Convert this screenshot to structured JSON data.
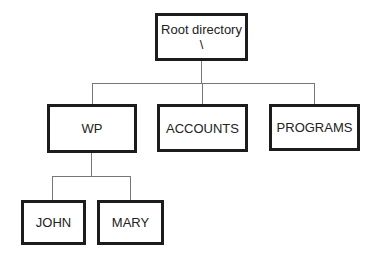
{
  "diagram": {
    "type": "directory-tree",
    "root": {
      "label": "Root directory",
      "symbol": "\\"
    },
    "level1": [
      {
        "label": "WP"
      },
      {
        "label": "ACCOUNTS"
      },
      {
        "label": "PROGRAMS"
      }
    ],
    "wp_children": [
      {
        "label": "JOHN"
      },
      {
        "label": "MARY"
      }
    ],
    "edges": [
      [
        "Root directory",
        "WP"
      ],
      [
        "Root directory",
        "ACCOUNTS"
      ],
      [
        "Root directory",
        "PROGRAMS"
      ],
      [
        "WP",
        "JOHN"
      ],
      [
        "WP",
        "MARY"
      ]
    ]
  }
}
